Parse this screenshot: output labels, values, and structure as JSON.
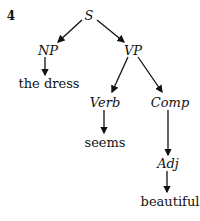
{
  "example_number": "4",
  "tree": {
    "root": {
      "label": "S"
    },
    "nodes": {
      "np": {
        "label": "NP"
      },
      "vp": {
        "label": "VP"
      },
      "np_word": {
        "label": "the dress"
      },
      "verb": {
        "label": "Verb"
      },
      "comp": {
        "label": "Comp"
      },
      "verb_word": {
        "label": "seems"
      },
      "adj": {
        "label": "Adj"
      },
      "adj_word": {
        "label": "beautiful"
      }
    },
    "edges": [
      [
        "S",
        "NP"
      ],
      [
        "S",
        "VP"
      ],
      [
        "NP",
        "the dress"
      ],
      [
        "VP",
        "Verb"
      ],
      [
        "VP",
        "Comp"
      ],
      [
        "Verb",
        "seems"
      ],
      [
        "Comp",
        "Adj"
      ],
      [
        "Adj",
        "beautiful"
      ]
    ]
  },
  "colors": {
    "ink": "#111111",
    "background": "#ffffff"
  }
}
